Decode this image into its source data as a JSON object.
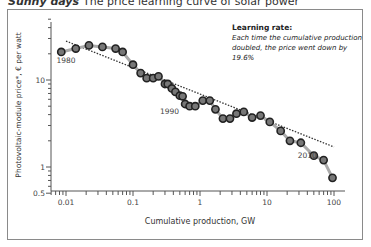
{
  "header": {
    "title_bold": "Sunny days",
    "title_rest": "The price learning curve of solar power"
  },
  "annotation": {
    "heading": "Learning rate:",
    "line1": "Each time the cumulative production",
    "line2": "doubled, the price went down by 19.6%"
  },
  "chart_data": {
    "type": "scatter",
    "xlabel": "Cumulative production, GW",
    "ylabel": "Photovoltaic-module price*, € per watt",
    "xscale": "log",
    "yscale": "log",
    "xlim": [
      0.006,
      150
    ],
    "ylim": [
      0.5,
      50
    ],
    "x_ticks": [
      "0.01",
      "0.1",
      "1",
      "10",
      "100"
    ],
    "y_ticks": [
      "0.5",
      "1",
      "10"
    ],
    "grid": false,
    "legend": null,
    "year_labels": [
      {
        "label": "1980",
        "x": 0.01,
        "y": 21
      },
      {
        "label": "1990",
        "x": 0.35,
        "y": 5.4
      },
      {
        "label": "2010",
        "x": 40,
        "y": 1.7
      }
    ],
    "trendline": {
      "style": "dotted",
      "x": [
        0.01,
        100
      ],
      "y": [
        28,
        1.7
      ],
      "learning_rate_pct": 19.6
    },
    "series": [
      {
        "name": "PV module price",
        "x": [
          0.0085,
          0.014,
          0.022,
          0.035,
          0.055,
          0.07,
          0.1,
          0.13,
          0.16,
          0.2,
          0.24,
          0.3,
          0.33,
          0.38,
          0.43,
          0.5,
          0.55,
          0.6,
          0.7,
          0.85,
          1.1,
          1.4,
          1.7,
          2.2,
          2.8,
          3.5,
          4.5,
          6,
          8,
          11,
          16,
          22,
          32,
          50,
          70,
          95
        ],
        "y": [
          21,
          23,
          25,
          24,
          23,
          21,
          15,
          12,
          10.5,
          10.5,
          11,
          9,
          9,
          8,
          7.3,
          6.6,
          6.5,
          5.3,
          5.0,
          5.0,
          5.8,
          5.8,
          4.6,
          3.6,
          3.6,
          4.1,
          4.3,
          3.7,
          3.9,
          3.3,
          2.6,
          2.0,
          1.9,
          1.35,
          1.2,
          0.75
        ]
      }
    ]
  },
  "axis": {
    "ylabel": "Photovoltaic-module price*, € per watt",
    "xlabel": "Cumulative production, GW",
    "yticks": [
      "10",
      "1",
      "0.5"
    ],
    "xticks": [
      "0.01",
      "0.1",
      "1",
      "10",
      "100"
    ],
    "years": [
      "1980",
      "1990",
      "2010"
    ]
  }
}
